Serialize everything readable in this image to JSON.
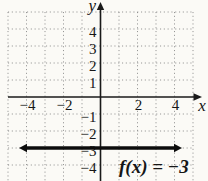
{
  "figure": {
    "bg_color": "#fbfaf6",
    "axis_color": "#1a1a1a",
    "grid_color": "#8a8a8a",
    "function_line_color": "#0c0c0c",
    "text_color": "#161616"
  },
  "chart_data": {
    "type": "line",
    "title": "",
    "xlabel": "x",
    "ylabel": "y",
    "xlim": [
      -5,
      5
    ],
    "ylim": [
      -5,
      5
    ],
    "grid": true,
    "grid_step": 1,
    "x_ticks_labeled": [
      {
        "value": -4,
        "label": "−4"
      },
      {
        "value": -2,
        "label": "−2"
      },
      {
        "value": 2,
        "label": "2"
      },
      {
        "value": 4,
        "label": "4"
      }
    ],
    "y_ticks_labeled": [
      {
        "value": 4,
        "label": "4"
      },
      {
        "value": 3,
        "label": "3"
      },
      {
        "value": 2,
        "label": "2"
      },
      {
        "value": 1,
        "label": "1"
      },
      {
        "value": -1,
        "label": "−1"
      },
      {
        "value": -2,
        "label": "−2"
      },
      {
        "value": -3,
        "label": "−3"
      },
      {
        "value": -4,
        "label": "−4"
      }
    ],
    "series": [
      {
        "name": "f(x) = −3",
        "kind": "horizontal-line",
        "y": -3,
        "x_extent": [
          -4.35,
          4.35
        ],
        "arrows": "both",
        "bold": true
      }
    ],
    "annotations": [
      {
        "text": "f(x) = −3",
        "x": 1.0,
        "y": -4.25
      }
    ]
  }
}
